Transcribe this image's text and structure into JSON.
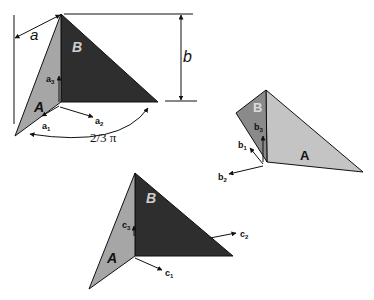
{
  "figure": {
    "colors": {
      "face_A": "#a6a6a6",
      "face_B": "#2e2e2e",
      "face_A_light": "#c4c4c4",
      "face_B_mid": "#8a8a8a",
      "line": "#111111",
      "label_on_dark": "#cfcfcf"
    },
    "config_a": {
      "face_A_label": "A",
      "face_B_label": "B",
      "dim_a_label": "a",
      "dim_b_label": "b",
      "angle_label": "2/3 π",
      "vectors": [
        {
          "name": "a",
          "sub": "1"
        },
        {
          "name": "a",
          "sub": "2"
        },
        {
          "name": "a",
          "sub": "3"
        }
      ]
    },
    "config_b": {
      "face_A_label": "A",
      "face_B_label": "B",
      "vectors": [
        {
          "name": "b",
          "sub": "1"
        },
        {
          "name": "b",
          "sub": "2"
        },
        {
          "name": "b",
          "sub": "3"
        }
      ]
    },
    "config_c": {
      "face_A_label": "A",
      "face_B_label": "B",
      "vectors": [
        {
          "name": "c",
          "sub": "1"
        },
        {
          "name": "c",
          "sub": "2"
        },
        {
          "name": "c",
          "sub": "3"
        }
      ]
    }
  }
}
